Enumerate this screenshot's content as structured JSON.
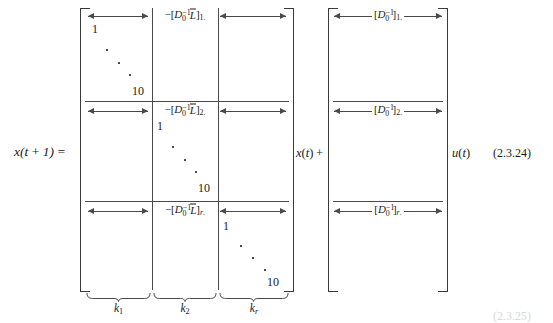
{
  "equation": {
    "lhs": "x(t + 1) =",
    "between_matrices": "x(t) +",
    "after_second_matrix": "u(t)",
    "tag": "(2.3.24)",
    "tag_ghost": "(2.3.25)"
  },
  "matrix_a": {
    "name": "state-transition-matrix",
    "rows": [
      {
        "index": 1,
        "cells": [
          {
            "type": "diagonal",
            "start": "1",
            "end": "10",
            "arrow": "both",
            "label": ""
          },
          {
            "type": "arrow",
            "arrow": "both",
            "label": "-[D0^-1 Lbar]1."
          },
          {
            "type": "arrow",
            "arrow": "both",
            "label": ""
          }
        ]
      },
      {
        "index": 2,
        "cells": [
          {
            "type": "arrow",
            "arrow": "both",
            "label": ""
          },
          {
            "type": "diagonal",
            "start": "1",
            "end": "10",
            "arrow": "both",
            "label": "-[D0^-1 Lbar]2."
          },
          {
            "type": "arrow",
            "arrow": "both",
            "label": ""
          }
        ]
      },
      {
        "index": 3,
        "cells": [
          {
            "type": "arrow",
            "arrow": "both",
            "label": ""
          },
          {
            "type": "arrow",
            "arrow": "both",
            "label": "-[D0^-1 Lbar]r."
          },
          {
            "type": "diagonal",
            "start": "1",
            "end": "10",
            "arrow": "both",
            "label": ""
          }
        ]
      }
    ],
    "column_labels": [
      "k1",
      "k2",
      "kr"
    ],
    "block_labels": [
      "-[D0^-1 Lbar]1.",
      "-[D0^-1 Lbar]2.",
      "-[D0^-1 Lbar]r."
    ],
    "diagonal_start": "1",
    "diagonal_end": "10"
  },
  "matrix_b": {
    "name": "input-matrix",
    "rows": [
      {
        "index": 1,
        "label": "[D0^-1]1."
      },
      {
        "index": 2,
        "label": "[D0^-1]2."
      },
      {
        "index": 3,
        "label": "[D0^-1]r."
      }
    ]
  },
  "symbols": {
    "D": "D",
    "zero_sub": "0",
    "inv_sup": "-1",
    "L": "L",
    "k": "k",
    "row_subs": [
      "1.",
      "2.",
      "r."
    ],
    "col_subs": [
      "1",
      "2",
      "r"
    ]
  },
  "colors": {
    "ink": "#1a1a1a",
    "rule": "#4a4a4a",
    "bracket": "#3a3a3a",
    "page": "#ffffff",
    "ghost": "#d8d8d8"
  }
}
